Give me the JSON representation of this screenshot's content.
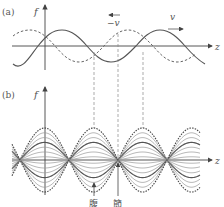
{
  "panel_a": {
    "label": "(a)",
    "y_axis_label": "f",
    "x_axis_label": "z",
    "left_wave_label": "−v",
    "right_wave_label": "v",
    "description": "Two sinusoidal traveling waves: solid moving right with speed v, dashed moving left with speed -v"
  },
  "panel_b": {
    "label": "(b)",
    "y_axis_label": "f",
    "x_axis_label": "z",
    "antinode_label": "腹",
    "node_label": "節",
    "description": "Standing wave formed by superposition: family of curves at successive times with fixed nodes and antinodes"
  },
  "colors": {
    "line": "#555555",
    "light_line": "#9a9a9a",
    "axis": "#444444"
  }
}
